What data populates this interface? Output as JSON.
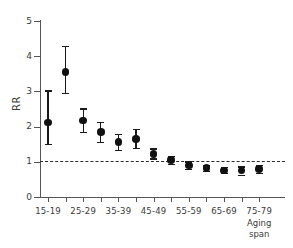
{
  "chart_data": {
    "type": "scatter",
    "title": "",
    "subtitle": "",
    "xlabel": "Aging span",
    "ylabel": "RR",
    "ylim": [
      0,
      5
    ],
    "yticks": [
      0,
      1,
      2,
      3,
      4,
      5
    ],
    "ytick_labels": [
      "0",
      "1",
      "2",
      "3",
      "4",
      "5"
    ],
    "grid": false,
    "legend": null,
    "reference_line": {
      "y": 1,
      "style": "dashed",
      "color": "#2b2b2b"
    },
    "categories": [
      "15-19",
      "20-24",
      "25-29",
      "30-34",
      "35-39",
      "40-44",
      "45-49",
      "50-54",
      "55-59",
      "60-64",
      "65-69",
      "70-74",
      "75-79"
    ],
    "xtick_labels": [
      "15-19",
      "",
      "25-29",
      "",
      "35-39",
      "",
      "45-49",
      "",
      "55-59",
      "",
      "65-69",
      "",
      "75-79"
    ],
    "series": [
      {
        "name": "Relative risk (RR)",
        "values": [
          2.12,
          3.55,
          2.17,
          1.85,
          1.56,
          1.65,
          1.23,
          1.05,
          0.9,
          0.82,
          0.76,
          0.75,
          0.8
        ],
        "ci_low": [
          1.51,
          2.95,
          1.84,
          1.57,
          1.33,
          1.4,
          1.1,
          0.95,
          0.8,
          0.74,
          0.68,
          0.64,
          0.69
        ],
        "ci_high": [
          3.03,
          4.3,
          2.52,
          2.13,
          1.8,
          1.94,
          1.38,
          1.17,
          1.01,
          0.9,
          0.85,
          0.87,
          0.92
        ]
      }
    ]
  },
  "axis": {
    "y_label": "RR",
    "x_title": "Aging\nspan"
  }
}
